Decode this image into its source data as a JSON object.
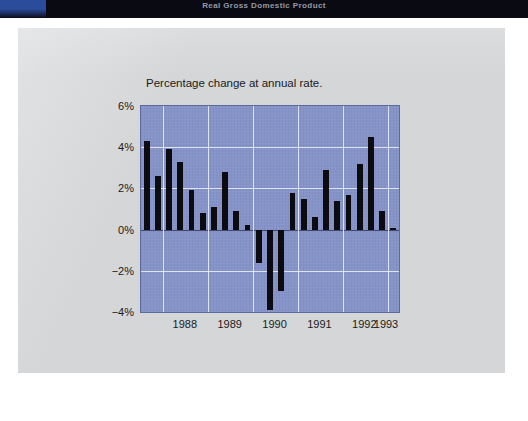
{
  "banner": {
    "title": "Real Gross Domestic Product",
    "accent_color": "#2b4b9b",
    "background_color": "#0a0a12"
  },
  "card": {
    "background_color": "#d4d6d8"
  },
  "chart_data": {
    "type": "bar",
    "title": "Real Gross Domestic Product",
    "subtitle": "Percentage change at annual rate.",
    "xlabel": "",
    "ylabel": "",
    "ylim": [
      -4,
      6
    ],
    "ytick_labels": [
      "6%",
      "4%",
      "2%",
      "0%",
      "−2%",
      "−4%"
    ],
    "ytick_values": [
      6,
      4,
      2,
      0,
      -2,
      -4
    ],
    "xtick_labels": [
      "1988",
      "1989",
      "1990",
      "1991",
      "1992",
      "1993"
    ],
    "xtick_values": [
      1988,
      1989,
      1990,
      1991,
      1992,
      1993
    ],
    "grid": true,
    "legend": "none",
    "plot_background_color": "#8593c9",
    "gridline_color": "#e8ecf6",
    "bar_color": "#0b0b10",
    "categories": [
      "1987Q3",
      "1987Q4",
      "1988Q1",
      "1988Q2",
      "1988Q3",
      "1988Q4",
      "1989Q1",
      "1989Q2",
      "1989Q3",
      "1989Q4",
      "1990Q1",
      "1990Q2",
      "1990Q3",
      "1990Q4",
      "1991Q1",
      "1991Q2",
      "1991Q3",
      "1991Q4",
      "1992Q1",
      "1992Q2",
      "1992Q3",
      "1992Q4",
      "1993Q1"
    ],
    "values": [
      4.3,
      2.6,
      3.9,
      3.3,
      1.9,
      0.8,
      1.1,
      2.8,
      0.9,
      0.2,
      -1.6,
      -3.9,
      -3.0,
      1.8,
      1.5,
      0.6,
      2.9,
      1.4,
      1.7,
      3.2,
      4.5,
      0.9,
      0.1
    ]
  }
}
